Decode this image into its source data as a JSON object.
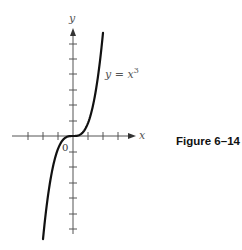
{
  "chart_data": {
    "type": "line",
    "title": "",
    "caption": "Figure 6–14",
    "series": [
      {
        "name": "y = x^3",
        "label": "y = x³",
        "function": "x^3",
        "x_range": [
          -2,
          2
        ]
      }
    ],
    "xlabel": "x",
    "ylabel": "y",
    "origin_label": "0",
    "x_ticks_count": {
      "negative": 3,
      "positive": 3
    },
    "y_ticks_count": {
      "positive": 6,
      "negative": 6
    },
    "tick_labels": [],
    "grid": false,
    "legend": "none",
    "annotations": [
      {
        "text": "y = x³",
        "position": "right of curve, upper branch"
      }
    ],
    "colors": {
      "curve": "#111111",
      "axes": "#555555"
    }
  },
  "labels": {
    "x_axis": "x",
    "y_axis": "y",
    "origin": "0",
    "curve_main": "y = x",
    "curve_exp": "3",
    "caption": "Figure 6–14"
  }
}
